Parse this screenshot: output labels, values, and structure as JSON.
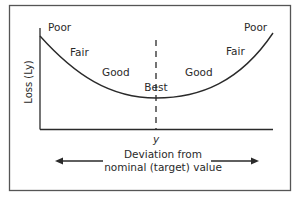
{
  "diagram": {
    "type": "quadratic-loss-function",
    "y_axis_label": "Loss (Ly)",
    "x_tick_label": "y",
    "x_caption_line1": "Deviation from",
    "x_caption_line2": "nominal (target) value",
    "zones_left": [
      "Poor",
      "Fair",
      "Good"
    ],
    "center_label": "Best",
    "zones_right": [
      "Good",
      "Fair",
      "Poor"
    ],
    "colors": {
      "line": "#2a2a2a",
      "frame": "#555555",
      "background": "#ffffff"
    }
  }
}
